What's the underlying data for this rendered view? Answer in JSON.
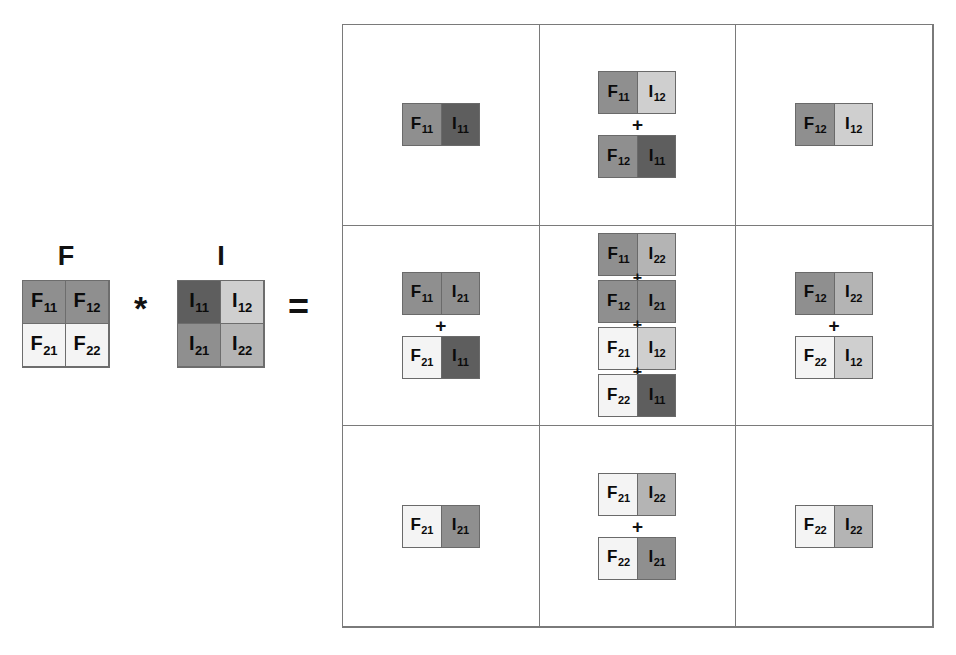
{
  "figure": {
    "operator_multiply": "*",
    "operator_equals": "=",
    "kernel": {
      "label": "F",
      "cells": [
        {
          "name": "F11",
          "base": "F",
          "sub": "11",
          "shade": "med"
        },
        {
          "name": "F12",
          "base": "F",
          "sub": "12",
          "shade": "med"
        },
        {
          "name": "F21",
          "base": "F",
          "sub": "21",
          "shade": "white"
        },
        {
          "name": "F22",
          "base": "F",
          "sub": "22",
          "shade": "white"
        }
      ]
    },
    "image": {
      "label": "I",
      "cells": [
        {
          "name": "I11",
          "base": "I",
          "sub": "11",
          "shade": "dark"
        },
        {
          "name": "I12",
          "base": "I",
          "sub": "12",
          "shade": "light"
        },
        {
          "name": "I21",
          "base": "I",
          "sub": "21",
          "shade": "med"
        },
        {
          "name": "I22",
          "base": "I",
          "sub": "22",
          "shade": "midlt"
        }
      ]
    },
    "shades": {
      "dark": "#5e5e5e",
      "med": "#8f8f8f",
      "midlt": "#b4b4b4",
      "light": "#cfcfcf",
      "white": "#f4f4f4"
    },
    "plus_symbol": "+",
    "result": {
      "rows": 3,
      "cols": 3,
      "cells": [
        {
          "position": "top-left",
          "terms": [
            {
              "f": {
                "base": "F",
                "sub": "11",
                "shade": "med"
              },
              "i": {
                "base": "I",
                "sub": "11",
                "shade": "dark"
              }
            }
          ]
        },
        {
          "position": "top-center",
          "terms": [
            {
              "f": {
                "base": "F",
                "sub": "11",
                "shade": "med"
              },
              "i": {
                "base": "I",
                "sub": "12",
                "shade": "light"
              }
            },
            {
              "f": {
                "base": "F",
                "sub": "12",
                "shade": "med"
              },
              "i": {
                "base": "I",
                "sub": "11",
                "shade": "dark"
              }
            }
          ]
        },
        {
          "position": "top-right",
          "terms": [
            {
              "f": {
                "base": "F",
                "sub": "12",
                "shade": "med"
              },
              "i": {
                "base": "I",
                "sub": "12",
                "shade": "light"
              }
            }
          ]
        },
        {
          "position": "middle-left",
          "terms": [
            {
              "f": {
                "base": "F",
                "sub": "11",
                "shade": "med"
              },
              "i": {
                "base": "I",
                "sub": "21",
                "shade": "med"
              }
            },
            {
              "f": {
                "base": "F",
                "sub": "21",
                "shade": "white"
              },
              "i": {
                "base": "I",
                "sub": "11",
                "shade": "dark"
              }
            }
          ]
        },
        {
          "position": "middle-center",
          "terms": [
            {
              "f": {
                "base": "F",
                "sub": "11",
                "shade": "med"
              },
              "i": {
                "base": "I",
                "sub": "22",
                "shade": "midlt"
              }
            },
            {
              "f": {
                "base": "F",
                "sub": "12",
                "shade": "med"
              },
              "i": {
                "base": "I",
                "sub": "21",
                "shade": "med"
              }
            },
            {
              "f": {
                "base": "F",
                "sub": "21",
                "shade": "white"
              },
              "i": {
                "base": "I",
                "sub": "12",
                "shade": "light"
              }
            },
            {
              "f": {
                "base": "F",
                "sub": "22",
                "shade": "white"
              },
              "i": {
                "base": "I",
                "sub": "11",
                "shade": "dark"
              }
            }
          ]
        },
        {
          "position": "middle-right",
          "terms": [
            {
              "f": {
                "base": "F",
                "sub": "12",
                "shade": "med"
              },
              "i": {
                "base": "I",
                "sub": "22",
                "shade": "midlt"
              }
            },
            {
              "f": {
                "base": "F",
                "sub": "22",
                "shade": "white"
              },
              "i": {
                "base": "I",
                "sub": "12",
                "shade": "light"
              }
            }
          ]
        },
        {
          "position": "bottom-left",
          "terms": [
            {
              "f": {
                "base": "F",
                "sub": "21",
                "shade": "white"
              },
              "i": {
                "base": "I",
                "sub": "21",
                "shade": "med"
              }
            }
          ]
        },
        {
          "position": "bottom-center",
          "terms": [
            {
              "f": {
                "base": "F",
                "sub": "21",
                "shade": "white"
              },
              "i": {
                "base": "I",
                "sub": "22",
                "shade": "midlt"
              }
            },
            {
              "f": {
                "base": "F",
                "sub": "22",
                "shade": "white"
              },
              "i": {
                "base": "I",
                "sub": "21",
                "shade": "med"
              }
            }
          ]
        },
        {
          "position": "bottom-right",
          "terms": [
            {
              "f": {
                "base": "F",
                "sub": "22",
                "shade": "white"
              },
              "i": {
                "base": "I",
                "sub": "22",
                "shade": "midlt"
              }
            }
          ]
        }
      ]
    }
  }
}
